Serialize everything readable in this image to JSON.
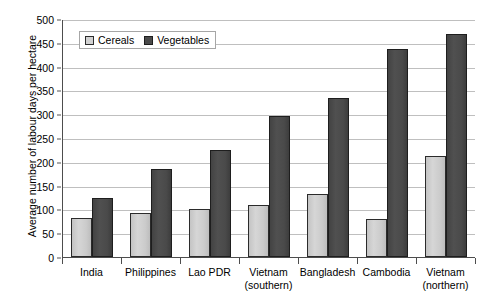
{
  "chart_data": {
    "type": "bar",
    "title": "",
    "xlabel": "",
    "ylabel": "Average number of labour days per hectare",
    "ylim": [
      0,
      500
    ],
    "ytick_step": 50,
    "yticks": [
      500,
      450,
      400,
      350,
      300,
      250,
      200,
      150,
      100,
      50,
      0
    ],
    "grid": true,
    "legend_position": "top-left-inside",
    "categories": [
      "India",
      "Philippines",
      "Lao PDR",
      "Vietnam (southern)",
      "Bangladesh",
      "Cambodia",
      "Vietnam (northern)"
    ],
    "category_lines": [
      [
        "India",
        ""
      ],
      [
        "Philippines",
        ""
      ],
      [
        "Lao PDR",
        ""
      ],
      [
        "Vietnam",
        "(southern)"
      ],
      [
        "Bangladesh",
        ""
      ],
      [
        "Cambodia",
        ""
      ],
      [
        "Vietnam",
        "(northern)"
      ]
    ],
    "series": [
      {
        "name": "Cereals",
        "color": "#d2d2d2",
        "values": [
          81,
          92,
          101,
          109,
          132,
          80,
          212
        ]
      },
      {
        "name": "Vegetables",
        "color": "#4a4a4a",
        "values": [
          124,
          185,
          225,
          296,
          335,
          438,
          468
        ]
      }
    ]
  },
  "legend": {
    "items": [
      {
        "label": "Cereals",
        "swatch": "cereals-swatch-icon"
      },
      {
        "label": "Vegetables",
        "swatch": "vegetables-swatch-icon"
      }
    ]
  }
}
